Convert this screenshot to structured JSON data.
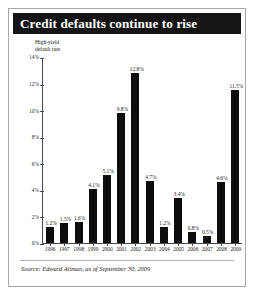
{
  "figure": {
    "title": "Credit defaults continue to rise",
    "axis_label_line1": "High-yield",
    "axis_label_line2": "default rate",
    "source": "Source: Edward Altman, as of September 30, 2009",
    "title_bar_color": "#141414",
    "bar_color": "#0d0d0d",
    "border_color": "#a8a8a8"
  },
  "chart_data": {
    "type": "bar",
    "title": "Credit defaults continue to rise",
    "xlabel": "",
    "ylabel": "High-yield default rate",
    "ylim": [
      0,
      14
    ],
    "ytick_labels": [
      "0%",
      "2%",
      "4%",
      "6%",
      "8%",
      "10%",
      "12%",
      "14%"
    ],
    "ytick_values": [
      0,
      2,
      4,
      6,
      8,
      10,
      12,
      14
    ],
    "grid": false,
    "legend": "none",
    "categories": [
      "1996",
      "1997",
      "1998",
      "1999",
      "2000",
      "2001",
      "2002",
      "2003",
      "2004",
      "2005",
      "2006",
      "2007",
      "2008",
      "2009"
    ],
    "values": [
      1.2,
      1.5,
      1.6,
      4.1,
      5.1,
      9.8,
      12.8,
      4.7,
      1.2,
      3.4,
      0.8,
      0.5,
      4.6,
      11.5
    ],
    "value_labels": [
      "1.2%",
      "1.5%",
      "1.6%",
      "4.1%",
      "5.1%",
      "9.8%",
      "12.8%",
      "4.7%",
      "1.2%",
      "3.4%",
      "0.8%",
      "0.5%",
      "4.6%",
      "11.5%"
    ],
    "source": "Source: Edward Altman, as of September 30, 2009"
  }
}
